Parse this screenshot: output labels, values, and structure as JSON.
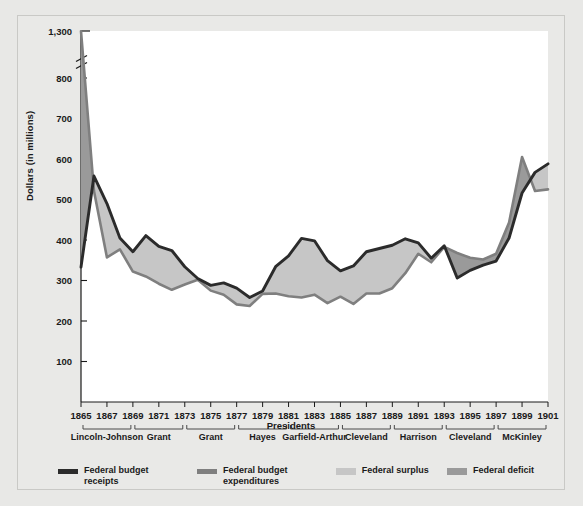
{
  "figure": {
    "y_axis_title": "Dollars (in millions)",
    "x_axis_title": "Presidents"
  },
  "legend": {
    "items": [
      {
        "name": "receipts",
        "label_line1": "Federal budget",
        "label_line2": "receipts",
        "color": "#2b2b2b",
        "swatch": "line"
      },
      {
        "name": "expenditures",
        "label_line1": "Federal budget",
        "label_line2": "expenditures",
        "color": "#7f7f7f",
        "swatch": "line"
      },
      {
        "name": "surplus",
        "label_line1": "Federal surplus",
        "label_line2": "",
        "color": "#c6c6c6",
        "swatch": "area"
      },
      {
        "name": "deficit",
        "label_line1": "Federal deficit",
        "label_line2": "",
        "color": "#9a9a9a",
        "swatch": "area"
      }
    ]
  },
  "chart_data": {
    "type": "area",
    "title": "",
    "xlabel": "Presidents",
    "ylabel": "Dollars (in millions)",
    "grid": false,
    "legend_position": "bottom",
    "y_ticks": [
      100,
      200,
      300,
      400,
      500,
      600,
      700,
      800,
      1300
    ],
    "y_tick_labels": [
      "100",
      "200",
      "300",
      "400",
      "500",
      "600",
      "700",
      "800",
      "1,300"
    ],
    "axis_break": {
      "between": [
        800,
        1300
      ],
      "label": "broken axis"
    },
    "ylim": [
      0,
      1300
    ],
    "x": [
      1865,
      1866,
      1867,
      1868,
      1869,
      1870,
      1871,
      1872,
      1873,
      1874,
      1875,
      1876,
      1877,
      1878,
      1879,
      1880,
      1881,
      1882,
      1883,
      1884,
      1885,
      1886,
      1887,
      1888,
      1889,
      1890,
      1891,
      1892,
      1893,
      1894,
      1895,
      1896,
      1897,
      1898,
      1899,
      1900,
      1901
    ],
    "x_tick_labels": [
      "1865",
      "1867",
      "1869",
      "1871",
      "1873",
      "1875",
      "1877",
      "1879",
      "1881",
      "1883",
      "1885",
      "1887",
      "1889",
      "1891",
      "1893",
      "1895",
      "1897",
      "1899",
      "1901"
    ],
    "president_terms": [
      {
        "label": "Lincoln-Johnson",
        "start": 1865,
        "end": 1869
      },
      {
        "label": "Grant",
        "start": 1869,
        "end": 1873
      },
      {
        "label": "Grant",
        "start": 1873,
        "end": 1877
      },
      {
        "label": "Hayes",
        "start": 1877,
        "end": 1881
      },
      {
        "label": "Garfield-Arthur",
        "start": 1881,
        "end": 1885
      },
      {
        "label": "Cleveland",
        "start": 1885,
        "end": 1889
      },
      {
        "label": "Harrison",
        "start": 1889,
        "end": 1893
      },
      {
        "label": "Cleveland",
        "start": 1893,
        "end": 1897
      },
      {
        "label": "McKinley",
        "start": 1897,
        "end": 1901
      }
    ],
    "series": [
      {
        "name": "Federal budget receipts",
        "color": "#2b2b2b",
        "values": [
          333,
          558,
          490,
          405,
          371,
          411,
          384,
          374,
          334,
          305,
          288,
          294,
          281,
          258,
          274,
          334,
          361,
          404,
          398,
          349,
          324,
          336,
          371,
          379,
          387,
          403,
          393,
          355,
          386,
          306,
          325,
          338,
          348,
          405,
          516,
          567,
          588
        ]
      },
      {
        "name": "Federal budget expenditures",
        "color": "#7f7f7f",
        "values": [
          1298,
          521,
          357,
          377,
          322,
          310,
          292,
          277,
          290,
          302,
          275,
          265,
          241,
          237,
          267,
          268,
          261,
          258,
          265,
          244,
          260,
          242,
          268,
          268,
          281,
          318,
          366,
          345,
          383,
          368,
          356,
          352,
          366,
          443,
          605,
          521,
          525
        ]
      }
    ],
    "fill_rules": {
      "surplus_color": "#c6c6c6",
      "surplus_when": "receipts > expenditures",
      "deficit_color": "#9a9a9a",
      "deficit_when": "expenditures > receipts"
    }
  }
}
